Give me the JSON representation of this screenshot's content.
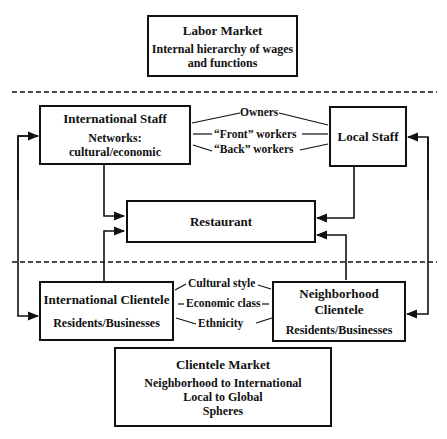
{
  "labor_market": {
    "title": "Labor Market",
    "line1": "Internal hierarchy of wages",
    "line2": "and functions"
  },
  "international_staff": {
    "title": "International Staff",
    "line1": "Networks:",
    "line2": "cultural/economic"
  },
  "local_staff": {
    "title": "Local Staff"
  },
  "staff_links": [
    "Owners",
    "“Front” workers",
    "“Back” workers"
  ],
  "restaurant": {
    "title": "Restaurant"
  },
  "international_clientele": {
    "title": "International Clientele",
    "line1": "Residents/Businesses"
  },
  "neighborhood_clientele": {
    "title_line1": "Neighborhood",
    "title_line2": "Clientele",
    "line1": "Residents/Businesses"
  },
  "clientele_links": [
    "Cultural style",
    "Economic class",
    "Ethnicity"
  ],
  "clientele_market": {
    "title": "Clientele Market",
    "line1": "Neighborhood to International",
    "line2": "Local to Global",
    "line3": "Spheres"
  }
}
